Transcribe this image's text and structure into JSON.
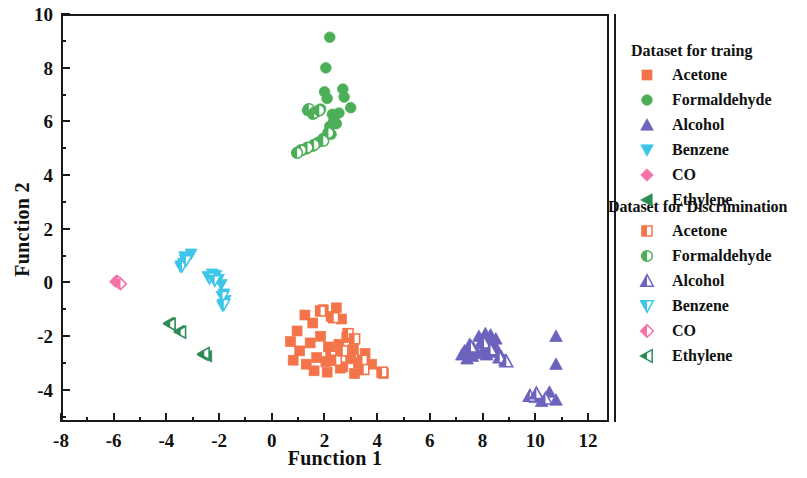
{
  "chart_data": {
    "type": "scatter",
    "title": "",
    "xlabel": "Function 1",
    "ylabel": "Function 2",
    "xlim": [
      -8,
      12.8
    ],
    "ylim": [
      -5.2,
      10
    ],
    "xticks": [
      -8,
      -6,
      -4,
      -2,
      0,
      2,
      4,
      6,
      8,
      10,
      12
    ],
    "yticks": [
      -4,
      -2,
      0,
      2,
      4,
      6,
      8,
      10
    ],
    "xtick_labels": [
      "-8",
      "-6",
      "-4",
      "-2",
      "0",
      "2",
      "4",
      "6",
      "8",
      "10",
      "12"
    ],
    "ytick_labels": [
      "-4",
      "-2",
      "0",
      "2",
      "4",
      "6",
      "8",
      "10"
    ],
    "minor_ticks": true,
    "grid": false,
    "legend_position": "right",
    "series": [
      {
        "name": "Acetone",
        "group": "training",
        "marker": "square",
        "color": "#F4744A",
        "points": [
          [
            0.95,
            -1.85
          ],
          [
            1.25,
            -1.25
          ],
          [
            1.55,
            -1.55
          ],
          [
            1.95,
            -1.05
          ],
          [
            2.25,
            -1.3
          ],
          [
            2.45,
            -0.98
          ],
          [
            2.65,
            -1.4
          ],
          [
            0.7,
            -2.25
          ],
          [
            1.05,
            -2.6
          ],
          [
            1.45,
            -2.3
          ],
          [
            1.85,
            -2.05
          ],
          [
            2.15,
            -2.45
          ],
          [
            2.55,
            -2.35
          ],
          [
            2.85,
            -2.1
          ],
          [
            3.1,
            -2.55
          ],
          [
            0.8,
            -2.95
          ],
          [
            1.3,
            -3.1
          ],
          [
            1.7,
            -2.85
          ],
          [
            2.05,
            -3.0
          ],
          [
            2.35,
            -2.75
          ],
          [
            2.7,
            -3.2
          ],
          [
            3.0,
            -2.9
          ],
          [
            3.3,
            -3.05
          ],
          [
            3.55,
            -2.7
          ],
          [
            1.6,
            -3.35
          ],
          [
            2.1,
            -3.4
          ],
          [
            2.6,
            -3.25
          ],
          [
            3.15,
            -3.45
          ],
          [
            3.8,
            -3.1
          ],
          [
            4.25,
            -3.45
          ]
        ]
      },
      {
        "name": "Acetone",
        "group": "discrimination",
        "marker": "square-half",
        "color": "#F4744A",
        "points": [
          [
            1.85,
            -1.1
          ],
          [
            2.35,
            -1.35
          ],
          [
            2.9,
            -1.95
          ],
          [
            3.15,
            -2.15
          ],
          [
            2.25,
            -2.8
          ],
          [
            2.45,
            -2.95
          ],
          [
            2.7,
            -2.6
          ],
          [
            3.45,
            -2.95
          ],
          [
            3.5,
            -3.3
          ],
          [
            4.2,
            -3.4
          ]
        ]
      },
      {
        "name": "Formaldehyde",
        "group": "training",
        "marker": "circle",
        "color": "#4CAF58",
        "points": [
          [
            2.2,
            9.2
          ],
          [
            2.05,
            8.05
          ],
          [
            2.0,
            7.15
          ],
          [
            2.1,
            6.9
          ],
          [
            2.7,
            7.25
          ],
          [
            2.75,
            6.95
          ],
          [
            3.0,
            6.55
          ],
          [
            2.55,
            6.35
          ],
          [
            2.3,
            6.3
          ],
          [
            2.45,
            5.95
          ],
          [
            1.85,
            6.5
          ],
          [
            1.7,
            6.4
          ],
          [
            1.55,
            6.3
          ],
          [
            1.35,
            6.45
          ],
          [
            2.2,
            5.85
          ],
          [
            2.25,
            5.55
          ],
          [
            1.95,
            5.4
          ],
          [
            1.75,
            5.25
          ],
          [
            1.55,
            5.1
          ],
          [
            1.3,
            5.0
          ],
          [
            1.15,
            4.95
          ],
          [
            1.0,
            4.9
          ],
          [
            2.35,
            6.05
          ]
        ]
      },
      {
        "name": "Formaldehyde",
        "group": "discrimination",
        "marker": "circle-half",
        "color": "#4CAF58",
        "points": [
          [
            1.4,
            6.5
          ],
          [
            1.6,
            6.35
          ],
          [
            1.8,
            6.45
          ],
          [
            2.15,
            5.6
          ],
          [
            1.95,
            5.3
          ],
          [
            1.6,
            5.15
          ],
          [
            1.35,
            5.05
          ],
          [
            1.1,
            4.95
          ],
          [
            0.95,
            4.85
          ]
        ]
      },
      {
        "name": "Alcohol",
        "group": "training",
        "marker": "triangle-up",
        "color": "#6B63BD",
        "points": [
          [
            7.35,
            -2.6
          ],
          [
            7.55,
            -2.35
          ],
          [
            7.7,
            -2.5
          ],
          [
            7.9,
            -2.05
          ],
          [
            8.0,
            -2.25
          ],
          [
            8.15,
            -1.95
          ],
          [
            8.25,
            -2.2
          ],
          [
            8.35,
            -2.0
          ],
          [
            8.45,
            -2.35
          ],
          [
            8.55,
            -2.15
          ],
          [
            7.45,
            -2.9
          ],
          [
            7.65,
            -2.8
          ],
          [
            7.85,
            -2.7
          ],
          [
            8.05,
            -2.6
          ],
          [
            8.2,
            -2.75
          ],
          [
            8.4,
            -2.65
          ],
          [
            8.6,
            -2.55
          ],
          [
            8.75,
            -2.8
          ],
          [
            8.9,
            -2.95
          ],
          [
            7.25,
            -2.75
          ],
          [
            10.85,
            -2.05
          ],
          [
            10.85,
            -3.1
          ],
          [
            10.6,
            -4.15
          ],
          [
            10.85,
            -4.45
          ],
          [
            10.3,
            -4.5
          ],
          [
            10.05,
            -4.35
          ]
        ]
      },
      {
        "name": "Alcohol",
        "group": "discrimination",
        "marker": "triangle-up-half",
        "color": "#6B63BD",
        "points": [
          [
            7.6,
            -2.45
          ],
          [
            8.1,
            -2.3
          ],
          [
            8.35,
            -2.55
          ],
          [
            8.7,
            -2.85
          ],
          [
            8.95,
            -3.0
          ],
          [
            9.85,
            -4.3
          ],
          [
            10.1,
            -4.2
          ],
          [
            10.45,
            -4.4
          ]
        ]
      },
      {
        "name": "Benzene",
        "group": "training",
        "marker": "triangle-down",
        "color": "#3DC6E8",
        "points": [
          [
            -3.1,
            1.05
          ],
          [
            -3.25,
            0.85
          ],
          [
            -3.4,
            0.7
          ],
          [
            -3.5,
            0.55
          ],
          [
            -2.3,
            0.3
          ],
          [
            -2.15,
            0.25
          ],
          [
            -2.05,
            0.1
          ],
          [
            -1.95,
            -0.1
          ],
          [
            -1.85,
            -0.45
          ],
          [
            -1.8,
            -0.7
          ],
          [
            -1.9,
            -0.9
          ],
          [
            -3.35,
            0.95
          ],
          [
            -2.45,
            0.2
          ]
        ]
      },
      {
        "name": "Benzene",
        "group": "discrimination",
        "marker": "triangle-down-half",
        "color": "#3DC6E8",
        "points": [
          [
            -3.45,
            0.6
          ],
          [
            -3.3,
            0.8
          ],
          [
            -2.4,
            0.15
          ],
          [
            -2.2,
            0.05
          ],
          [
            -1.9,
            -0.55
          ],
          [
            -1.85,
            -0.85
          ]
        ]
      },
      {
        "name": "CO",
        "group": "training",
        "marker": "diamond",
        "color": "#F472A8",
        "points": [
          [
            -5.95,
            0.05
          ],
          [
            -5.85,
            -0.05
          ],
          [
            -6.0,
            0.0
          ]
        ]
      },
      {
        "name": "CO",
        "group": "discrimination",
        "marker": "diamond-half",
        "color": "#F472A8",
        "points": [
          [
            -5.9,
            0.0
          ],
          [
            -5.8,
            -0.08
          ]
        ]
      },
      {
        "name": "Ethylene",
        "group": "training",
        "marker": "triangle-left",
        "color": "#2E8B57",
        "points": [
          [
            -3.95,
            -1.55
          ],
          [
            -3.55,
            -1.85
          ],
          [
            -2.65,
            -2.75
          ],
          [
            -2.5,
            -2.8
          ]
        ]
      },
      {
        "name": "Ethylene",
        "group": "discrimination",
        "marker": "triangle-left-half",
        "color": "#2E8B57",
        "points": [
          [
            -3.9,
            -1.6
          ],
          [
            -3.5,
            -1.9
          ],
          [
            -2.6,
            -2.7
          ]
        ]
      }
    ]
  },
  "axes": {
    "xlabel": "Function 1",
    "ylabel": "Function 2"
  },
  "legend": {
    "group1_title": "Dataset for traing",
    "group2_title": "Dataset for Discrimination",
    "group1_items": [
      {
        "label": "Acetone",
        "marker": "square",
        "color": "#F4744A"
      },
      {
        "label": "Formaldehyde",
        "marker": "circle",
        "color": "#4CAF58"
      },
      {
        "label": "Alcohol",
        "marker": "triangle-up",
        "color": "#6B63BD"
      },
      {
        "label": "Benzene",
        "marker": "triangle-down",
        "color": "#3DC6E8"
      },
      {
        "label": "CO",
        "marker": "diamond",
        "color": "#F472A8"
      },
      {
        "label": "Ethylene",
        "marker": "triangle-left",
        "color": "#2E8B57"
      }
    ],
    "group2_items": [
      {
        "label": "Acetone",
        "marker": "square-half",
        "color": "#F4744A"
      },
      {
        "label": "Formaldehyde",
        "marker": "circle-half",
        "color": "#4CAF58"
      },
      {
        "label": "Alcohol",
        "marker": "triangle-up-half",
        "color": "#6B63BD"
      },
      {
        "label": "Benzene",
        "marker": "triangle-down-half",
        "color": "#3DC6E8"
      },
      {
        "label": "CO",
        "marker": "diamond-half",
        "color": "#F472A8"
      },
      {
        "label": "Ethylene",
        "marker": "triangle-left-half",
        "color": "#2E8B57"
      }
    ]
  }
}
